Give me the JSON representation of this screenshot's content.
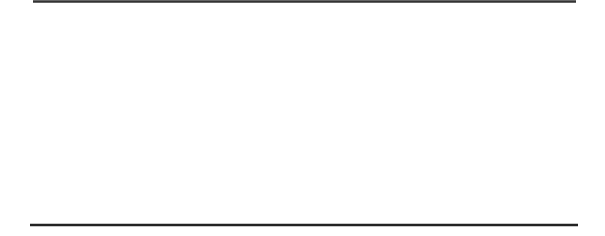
{
  "puzzle": {
    "type": "paper-folding-hole-punch",
    "colors": {
      "stroke": "#111111",
      "filled": "#000000",
      "empty": "#ffffff",
      "rule": "#333333"
    },
    "steps": [
      {
        "name": "fold-1",
        "dashed_region": [
          33,
          51
        ],
        "solid_rect": [
          51,
          106
        ],
        "divider_x": 69,
        "hole": null
      },
      {
        "name": "fold-2",
        "dashed_region": [
          150,
          186
        ],
        "solid_rect": [
          186,
          223
        ],
        "divider_x": 205,
        "hole": null
      },
      {
        "name": "punch",
        "dashed_region": [
          267,
          303
        ],
        "solid_rect": [
          303,
          339
        ],
        "divider_x": 322,
        "hole": {
          "cx": 313,
          "cy": 34,
          "r": 5
        }
      }
    ],
    "options": [
      {
        "label": "A",
        "x": 32,
        "filled": [
          [
            0,
            1
          ],
          [
            0,
            2
          ],
          [
            1,
            0
          ]
        ]
      },
      {
        "label": "B",
        "x": 149,
        "filled": [
          [
            0,
            0
          ],
          [
            1,
            1
          ],
          [
            2,
            1
          ],
          [
            3,
            0
          ]
        ]
      },
      {
        "label": "C",
        "x": 265,
        "filled": [
          [
            0,
            0
          ],
          [
            0,
            1
          ],
          [
            0,
            2
          ]
        ]
      },
      {
        "label": "D",
        "x": 382,
        "filled": [
          [
            1,
            0
          ],
          [
            1,
            1
          ],
          [
            1,
            2
          ]
        ]
      },
      {
        "label": "E",
        "x": 499,
        "filled": [
          [
            0,
            1
          ],
          [
            0,
            2
          ]
        ]
      }
    ]
  }
}
